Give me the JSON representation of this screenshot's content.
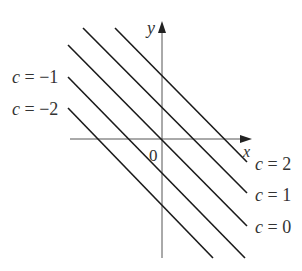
{
  "diagram": {
    "type": "level_curves",
    "axes": {
      "x_label": "x",
      "y_label": "y",
      "origin_label": "0"
    },
    "lines": [
      {
        "c": 2,
        "label": "c = 2",
        "x1": 115,
        "y1": 28,
        "x2": 247,
        "y2": 162
      },
      {
        "c": 1,
        "label": "c = 1",
        "x1": 83,
        "y1": 28,
        "x2": 247,
        "y2": 193
      },
      {
        "c": 0,
        "label": "c = 0",
        "x1": 68,
        "y1": 45,
        "x2": 247,
        "y2": 226
      },
      {
        "c": -1,
        "label": "c = −1",
        "x1": 68,
        "y1": 77,
        "x2": 245,
        "y2": 258
      },
      {
        "c": -2,
        "label": "c = −2",
        "x1": 68,
        "y1": 108,
        "x2": 213,
        "y2": 258
      }
    ],
    "labels": {
      "c_minus1": "c = −1",
      "c_minus2": "c = −2",
      "c_2": "c = 2",
      "c_1": "c = 1",
      "c_0": "c = 0"
    },
    "colors": {
      "line": "#1a1a1a",
      "axis": "#555555",
      "text": "#333333"
    }
  }
}
